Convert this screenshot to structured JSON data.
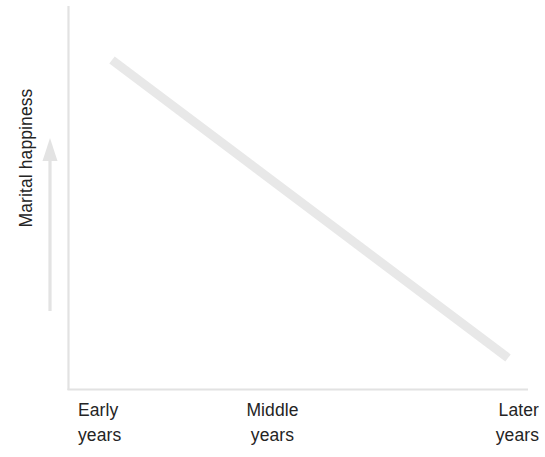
{
  "chart_data": {
    "type": "line",
    "title": "",
    "subtitle": "",
    "xlabel": "",
    "ylabel": "Marital happiness",
    "categories": [
      "Early years",
      "Middle years",
      "Later years"
    ],
    "category_lines": [
      [
        "Early",
        "years"
      ],
      [
        "Middle",
        "years"
      ],
      [
        "Later",
        "years"
      ]
    ],
    "series": [
      {
        "name": "Marital happiness",
        "values": [
          100,
          55,
          10
        ]
      }
    ],
    "x": [
      0,
      1,
      2
    ],
    "xlim": [
      0,
      2
    ],
    "ylim": [
      0,
      100
    ],
    "grid": false,
    "legend": false,
    "legend_position": "none",
    "axis_ticks": false,
    "annotations": [
      {
        "name": "y-direction-arrow",
        "description": "upward arrow indicating increasing marital happiness"
      }
    ],
    "colors": {
      "line": "#e8e8e8",
      "axis": "#e2e2e2",
      "arrow": "#e3e3e3",
      "text": "#242424",
      "background": "#ffffff"
    },
    "geometry": {
      "axis_x": 68,
      "axis_y_top": 6,
      "axis_y_bottom": 390,
      "axis_x_right": 528,
      "line_start": [
        112,
        60
      ],
      "line_end": [
        508,
        358
      ],
      "line_width": 9,
      "arrow_x": 50,
      "arrow_tip_y": 138,
      "arrow_tail_y": 311
    }
  }
}
